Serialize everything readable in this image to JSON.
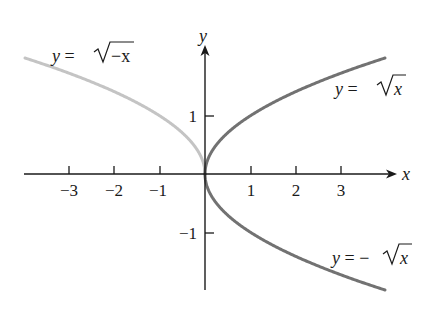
{
  "chart_data": {
    "type": "line",
    "title": "",
    "xlabel": "x",
    "ylabel": "y",
    "xlim": [
      -4,
      4.3
    ],
    "ylim": [
      -2,
      2.3
    ],
    "grid": false,
    "legend": "none (inline curve labels)",
    "x_ticks": [
      -3,
      -2,
      -1,
      1,
      2,
      3
    ],
    "x_tick_labels": [
      "−3",
      "−2",
      "−1",
      "1",
      "2",
      "3"
    ],
    "y_ticks": [
      1,
      -1
    ],
    "y_tick_labels": [
      "1",
      "−1"
    ],
    "series": [
      {
        "name": "y = √(−x)",
        "label_text": "y = √−x",
        "color": "#c4c4c4",
        "domain": [
          -4,
          0
        ],
        "x": [
          -4,
          -3,
          -2,
          -1,
          -0.5,
          0
        ],
        "y": [
          2,
          1.732,
          1.414,
          1,
          0.707,
          0
        ]
      },
      {
        "name": "y = √x",
        "label_text": "y = √x",
        "color": "#727272",
        "domain": [
          0,
          4
        ],
        "x": [
          0,
          0.5,
          1,
          2,
          3,
          4
        ],
        "y": [
          0,
          0.707,
          1,
          1.414,
          1.732,
          2
        ]
      },
      {
        "name": "y = −√x",
        "label_text": "y = −√x",
        "color": "#727272",
        "domain": [
          0,
          4
        ],
        "x": [
          0,
          0.5,
          1,
          2,
          3,
          4
        ],
        "y": [
          0,
          -0.707,
          -1,
          -1.414,
          -1.732,
          -2
        ]
      }
    ]
  },
  "labels": {
    "x_axis": "x",
    "y_axis": "y",
    "tick_x_neg3": "−3",
    "tick_x_neg2": "−2",
    "tick_x_neg1": "−1",
    "tick_x_1": "1",
    "tick_x_2": "2",
    "tick_x_3": "3",
    "tick_y_1": "1",
    "tick_y_neg1": "−1",
    "eq_left": {
      "y": "y",
      "eq": " = ",
      "rad": "−x"
    },
    "eq_top": {
      "y": "y",
      "eq": " = ",
      "rad": "x"
    },
    "eq_bottom": {
      "y": "y",
      "eq": " = −",
      "rad": "x"
    }
  },
  "colors": {
    "axis": "#1a1a1a",
    "left_curve": "#c4c4c4",
    "right_curves": "#727272"
  }
}
